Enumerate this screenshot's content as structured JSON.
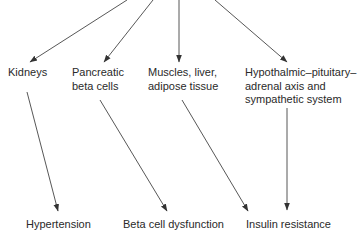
{
  "diagram": {
    "type": "flow",
    "line_color": "#333333",
    "middle_nodes": [
      {
        "id": "kidneys",
        "lines": [
          "Kidneys"
        ]
      },
      {
        "id": "pancreatic",
        "lines": [
          "Pancreatic",
          "beta cells"
        ]
      },
      {
        "id": "muscles",
        "lines": [
          "Muscles, liver,",
          "adipose tissue"
        ]
      },
      {
        "id": "hpa",
        "lines": [
          "Hypothalmic–pituitary–",
          "adrenal axis and",
          "sympathetic system"
        ]
      }
    ],
    "outcome_nodes": [
      {
        "id": "hypertension",
        "label": "Hypertension"
      },
      {
        "id": "beta-dysfunction",
        "label": "Beta cell dysfunction"
      },
      {
        "id": "insulin-resistance",
        "label": "Insulin resistance"
      }
    ],
    "edges": [
      {
        "from": "source",
        "to": "kidneys"
      },
      {
        "from": "source",
        "to": "pancreatic"
      },
      {
        "from": "source",
        "to": "muscles"
      },
      {
        "from": "source",
        "to": "hpa"
      },
      {
        "from": "kidneys",
        "to": "hypertension"
      },
      {
        "from": "pancreatic",
        "to": "beta-dysfunction"
      },
      {
        "from": "muscles",
        "to": "insulin-resistance"
      },
      {
        "from": "hpa",
        "to": "insulin-resistance"
      }
    ]
  }
}
